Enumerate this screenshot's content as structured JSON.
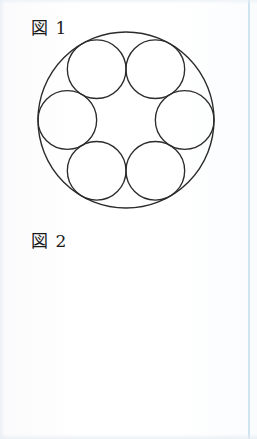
{
  "page": {
    "background_color": "#fefefe",
    "ink_color": "#2b2b2b",
    "margin_rule_color": "#b0d1e9"
  },
  "figures": [
    {
      "id": "figure-1",
      "caption": "図 1",
      "caption_text_cjk": "図",
      "caption_number": "1",
      "description": "One large outer circle containing six equal circles arranged in a ring, each internally tangent to the outer circle and tangent to its two neighbours.",
      "geometry": {
        "outer_circle": {
          "cx": 126,
          "cy": 120,
          "r": 88
        },
        "inner_circle_radius": 29.33,
        "inner_circle_count": 6,
        "ring_distance": 58.67,
        "start_angle_deg": 0,
        "levels": 1,
        "radial_lines": false
      }
    },
    {
      "id": "figure-2",
      "caption": "図 2",
      "caption_text_cjk": "図",
      "caption_number": "2",
      "description": "The same six-circle packing repeated recursively: the six inner circles of figure 1 surround a smaller ring of six circles, which surround a still smaller ring of six circles. Six straight radial lines run from the centre outward through the centres of the six large circles.",
      "geometry": {
        "outer_circle": {
          "cx": 126,
          "cy": 121,
          "r": 89
        },
        "inner_circle_radius": 29.67,
        "inner_circle_count": 6,
        "ring_distance": 59.33,
        "start_angle_deg": 0,
        "levels": 3,
        "level_scale": 0.3333,
        "radial_lines": true,
        "radial_line_count": 6,
        "radial_line_inner_fraction": 0.06,
        "radial_line_outer_fraction": 0.87
      }
    }
  ],
  "margin_rule": {
    "name": "right-margin-rule",
    "color": "#b0d1e9",
    "x": 248
  }
}
